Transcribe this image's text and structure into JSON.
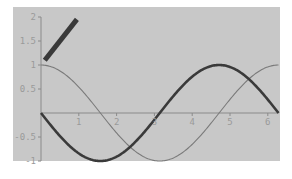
{
  "chart_data": {
    "type": "line",
    "title": "",
    "xlabel": "",
    "ylabel": "",
    "xlim": [
      0,
      6.2832
    ],
    "ylim": [
      -1,
      2
    ],
    "grid": false,
    "legend": null,
    "x_ticks": [
      1,
      2,
      3,
      4,
      5,
      6
    ],
    "x_tick_labels": [
      "1",
      "2",
      "3",
      "4",
      "5",
      "6"
    ],
    "y_ticks": [
      -1,
      -0.5,
      0.5,
      1,
      1.5,
      2
    ],
    "y_tick_labels": [
      "-1",
      "-0.5",
      "0.5",
      "1",
      "1.5",
      "2"
    ],
    "series": [
      {
        "name": "cos(x)",
        "style": "thin",
        "color": "#7a7a7a",
        "function": "cos",
        "x": [
          0,
          0.5236,
          1.0472,
          1.5708,
          2.0944,
          2.618,
          3.1416,
          3.6652,
          4.1888,
          4.7124,
          5.236,
          5.7596,
          6.2832
        ],
        "values": [
          1,
          0.866,
          0.5,
          0,
          -0.5,
          -0.866,
          -1,
          -0.866,
          -0.5,
          0,
          0.5,
          0.866,
          1
        ]
      },
      {
        "name": "-sin(x)",
        "style": "thick",
        "color": "#3a3a3a",
        "function": "negsin",
        "x": [
          0,
          0.5236,
          1.0472,
          1.5708,
          2.0944,
          2.618,
          3.1416,
          3.6652,
          4.1888,
          4.7124,
          5.236,
          5.7596,
          6.2832
        ],
        "values": [
          0,
          -0.5,
          -0.866,
          -1,
          -0.866,
          -0.5,
          0,
          0.5,
          0.866,
          1,
          0.866,
          0.5,
          0
        ]
      },
      {
        "name": "1+x",
        "style": "thick",
        "color": "#3a3a3a",
        "function": "line",
        "x": [
          0.1,
          0.95
        ],
        "values": [
          1.1,
          1.95
        ]
      }
    ]
  },
  "colors": {
    "panel_background": "#c8c8c8",
    "axis": "#8a8a8a",
    "tick_label": "#9a9a9a"
  }
}
